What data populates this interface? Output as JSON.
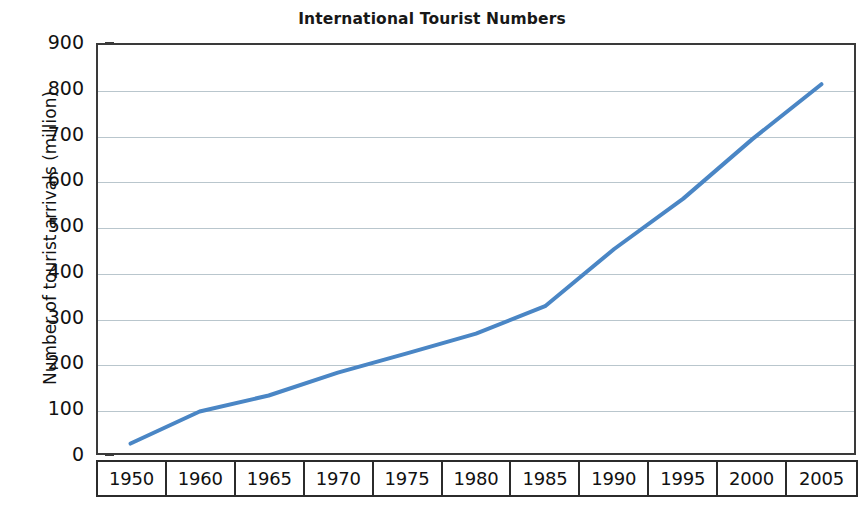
{
  "chart_data": {
    "type": "line",
    "title": "International Tourist Numbers",
    "xlabel": "",
    "ylabel": "Number of tourist arrivals (million)",
    "categories": [
      "1950",
      "1960",
      "1965",
      "1970",
      "1975",
      "1980",
      "1985",
      "1990",
      "1995",
      "2000",
      "2005"
    ],
    "values": [
      25,
      95,
      130,
      180,
      222,
      265,
      325,
      450,
      560,
      690,
      810
    ],
    "series": [
      {
        "name": "International tourist arrivals",
        "values": [
          25,
          95,
          130,
          180,
          222,
          265,
          325,
          450,
          560,
          690,
          810
        ]
      }
    ],
    "ylim": [
      0,
      900
    ],
    "ytick_labels": [
      "900",
      "800",
      "700",
      "600",
      "500",
      "400",
      "300",
      "200",
      "100",
      "0"
    ],
    "ytick_values": [
      900,
      800,
      700,
      600,
      500,
      400,
      300,
      200,
      100,
      0
    ],
    "ytick_step": 100,
    "grid": true,
    "grid_axis": "y",
    "legend": false,
    "legend_position": "none",
    "line_color": "#4a86c5",
    "grid_color": "#b9c6cd",
    "frame_color": "#3a3a3a",
    "text_color": "#121212",
    "background_color": "#ffffff",
    "annotations": []
  }
}
